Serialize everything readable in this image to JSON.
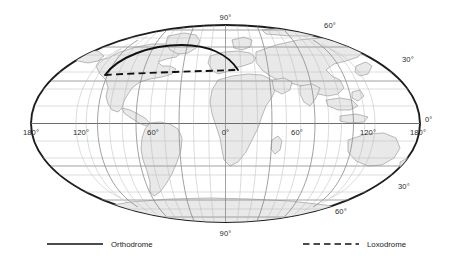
{
  "figure": {
    "type": "world-map-projection",
    "projection": "elliptical pseudocylindrical (Mollweide-like)",
    "background_color": "#ffffff",
    "land_fill_color": "#e9e9e9",
    "land_stroke_color": "#8f8f8f",
    "graticule_minor_color": "#b9b9b9",
    "graticule_major_color": "#8a8a8a",
    "border_color": "#1d1d1d",
    "route_color": "#111111"
  },
  "graticule": {
    "minor_interval_degrees": 10,
    "major_interval_degrees": 30,
    "longitude_labels_top": [
      {
        "text": "90°",
        "lon": 0
      },
      {
        "text": "60°",
        "lon": 60
      }
    ],
    "longitude_labels_equator": [
      {
        "text": "180°",
        "lon": -180
      },
      {
        "text": "120°",
        "lon": -120
      },
      {
        "text": "60°",
        "lon": -60
      },
      {
        "text": "0°",
        "lon": 0
      },
      {
        "text": "60°",
        "lon": 60
      },
      {
        "text": "120°",
        "lon": 120
      },
      {
        "text": "180°",
        "lon": 180
      }
    ],
    "latitude_labels_right": [
      {
        "text": "30°",
        "lat": 30
      },
      {
        "text": "0°",
        "lat": 0
      },
      {
        "text": "30°",
        "lat": -30
      },
      {
        "text": "60°",
        "lat": -60
      }
    ],
    "longitude_labels_bottom": [
      {
        "text": "90°",
        "lon": 0
      }
    ]
  },
  "routes": {
    "orthodrome": {
      "label": "Orthodrome",
      "style": "solid",
      "description": "great-circle arc bulging poleward between the two endpoints"
    },
    "loxodrome": {
      "label": "Loxodrome",
      "style": "dashed",
      "description": "rhumb line running nearly straight between the two endpoints"
    }
  },
  "legend": {
    "items": [
      {
        "label": "Orthodrome",
        "style": "solid"
      },
      {
        "label": "Loxodrome",
        "style": "dashed"
      }
    ]
  }
}
